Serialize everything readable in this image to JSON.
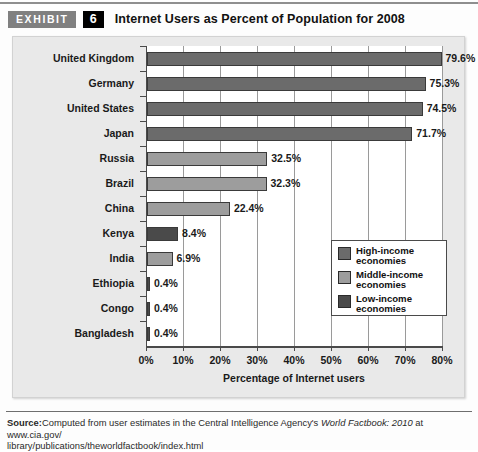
{
  "header": {
    "exhibit_label": "EXHIBIT",
    "exhibit_number": "6",
    "title": "Internet Users as Percent of Population for 2008"
  },
  "source": {
    "label": "Source:",
    "line1_a": "Computed from user estimates in the Central Intelligence Agency's ",
    "line1_italic": "World Factbook: 2010",
    "line1_b": " at www.cia.gov/",
    "line2": "library/publications/theworldfactbook/index.html"
  },
  "legend": {
    "items": [
      {
        "label_line1": "High-income",
        "label_line2": "economies",
        "color": "#6b6b6b"
      },
      {
        "label_line1": "Middle-income",
        "label_line2": "economies",
        "color": "#9d9d9d"
      },
      {
        "label_line1": "Low-income",
        "label_line2": "economies",
        "color": "#4a4a4a"
      }
    ]
  },
  "chart_data": {
    "type": "bar",
    "orientation": "horizontal",
    "title": "Internet Users as Percent of Population for 2008",
    "xlabel": "Percentage of Internet users",
    "ylabel": "",
    "xlim": [
      0,
      80
    ],
    "xticks": [
      0,
      10,
      20,
      30,
      40,
      50,
      60,
      70,
      80
    ],
    "xticklabels": [
      "0%",
      "10%",
      "20%",
      "30%",
      "40%",
      "50%",
      "60%",
      "70%",
      "80%"
    ],
    "grid": "vertical",
    "legend_position": "inside-right",
    "categories": [
      "United Kingdom",
      "Germany",
      "United States",
      "Japan",
      "Russia",
      "Brazil",
      "China",
      "Kenya",
      "India",
      "Ethiopia",
      "Congo",
      "Bangladesh"
    ],
    "values": [
      79.6,
      75.3,
      74.5,
      71.7,
      32.5,
      32.3,
      22.4,
      8.4,
      6.9,
      0.4,
      0.4,
      0.4
    ],
    "value_labels": [
      "79.6%",
      "75.3%",
      "74.5%",
      "71.7%",
      "32.5%",
      "32.3%",
      "22.4%",
      "8.4%",
      "6.9%",
      "0.4%",
      "0.4%",
      "0.4%"
    ],
    "groups": [
      "High-income",
      "High-income",
      "High-income",
      "High-income",
      "Middle-income",
      "Middle-income",
      "Middle-income",
      "Low-income",
      "Middle-income",
      "Low-income",
      "Low-income",
      "Low-income"
    ],
    "group_colors": {
      "High-income": "#6b6b6b",
      "Middle-income": "#9d9d9d",
      "Low-income": "#4a4a4a"
    }
  }
}
